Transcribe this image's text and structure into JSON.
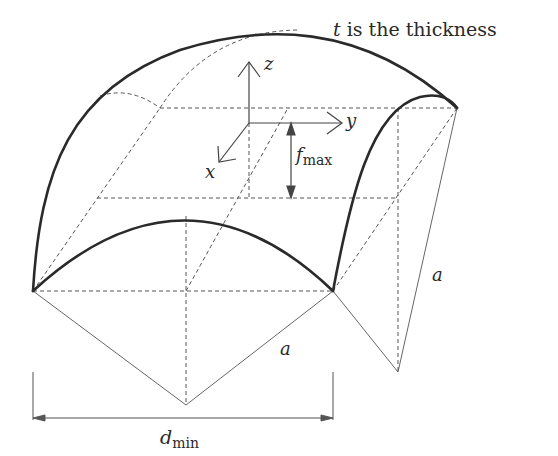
{
  "diagram": {
    "note": {
      "variable": "t",
      "text": " is the thickness"
    },
    "axes": {
      "x": "x",
      "y": "y",
      "z": "z"
    },
    "labels": {
      "f_max": {
        "main": "f",
        "sub": "max"
      },
      "a_front": "a",
      "a_right": "a",
      "d_min": {
        "main": "d",
        "sub": "min"
      }
    },
    "colors": {
      "stroke": "#2a2a2a",
      "thin_stroke": "#555555",
      "background": "#ffffff"
    }
  }
}
